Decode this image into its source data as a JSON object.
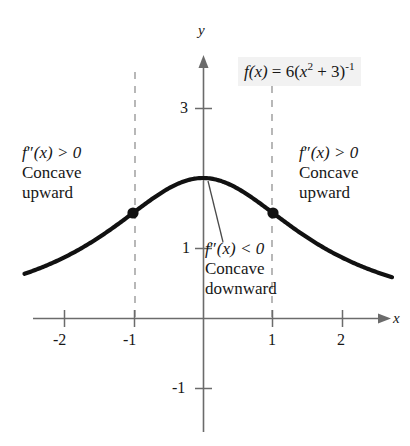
{
  "figure": {
    "background": "#ffffff",
    "curve_color": "#111111",
    "axis_color": "#6b6b6b",
    "dashed_color": "#9a9a9a",
    "label_bg": "#f2f2f2"
  },
  "axes": {
    "x_label": "x",
    "y_label": "y",
    "x_ticks": [
      "-2",
      "-1",
      "1",
      "2"
    ],
    "y_ticks": [
      "3",
      "1",
      "-1"
    ],
    "x_range": [
      -2.55,
      2.7
    ],
    "y_range": [
      -1.55,
      3.55
    ],
    "origin_px": [
      203,
      318
    ],
    "unit_px": 70
  },
  "formula": {
    "lead": "f",
    "arg": "(x)",
    "equals": "= 6(",
    "base": "x",
    "power": "2",
    "plus3": "+ 3)",
    "outer_power": "-1",
    "plain": "f(x) = 6(x² + 3)⁻¹"
  },
  "annotations": {
    "left": {
      "math_f": "f",
      "math_primes": "″",
      "math_rest": "(x) > 0",
      "line2": "Concave",
      "line3": "upward",
      "plain": "f″(x) > 0 Concave upward"
    },
    "right": {
      "math_f": "f",
      "math_primes": "″",
      "math_rest": "(x) > 0",
      "line2": "Concave",
      "line3": "upward",
      "plain": "f″(x) > 0 Concave upward"
    },
    "center": {
      "math_f": "f",
      "math_primes": "″",
      "math_rest": "(x) < 0",
      "line2": "Concave",
      "line3": "downward",
      "plain": "f″(x) < 0 Concave downward"
    }
  },
  "chart_data": {
    "type": "line",
    "xlabel": "x",
    "ylabel": "y",
    "xlim": [
      -2.55,
      2.7
    ],
    "ylim": [
      -1.55,
      3.55
    ],
    "xticks": [
      -2,
      -1,
      1,
      2
    ],
    "yticks": [
      3,
      1,
      -1
    ],
    "grid": false,
    "legend": "none",
    "series": [
      {
        "name": "f(x) = 6(x^2 + 3)^-1",
        "formula": "6/(x^2+3)",
        "x": [
          -2.45,
          -2.2,
          -2.0,
          -1.75,
          -1.5,
          -1.25,
          -1.0,
          -0.75,
          -0.5,
          -0.25,
          0.0,
          0.25,
          0.5,
          0.75,
          1.0,
          1.25,
          1.5,
          1.75,
          2.0,
          2.2,
          2.45
        ],
        "y": [
          0.665,
          0.76,
          0.857,
          0.97,
          1.143,
          1.309,
          1.5,
          1.68,
          1.846,
          1.959,
          2.0,
          1.959,
          1.846,
          1.68,
          1.5,
          1.309,
          1.143,
          0.97,
          0.857,
          0.76,
          0.665
        ]
      }
    ],
    "points_of_interest": [
      {
        "name": "inflection-point-left",
        "x": -1,
        "y": 1.5,
        "marker": "filled-circle"
      },
      {
        "name": "inflection-point-right",
        "x": 1,
        "y": 1.5,
        "marker": "filled-circle"
      },
      {
        "name": "maximum",
        "x": 0,
        "y": 2,
        "marker": "none"
      }
    ],
    "vertical_dashed_lines": [
      -1,
      1
    ],
    "annotations": [
      {
        "text": "f″(x) > 0 Concave upward",
        "region": "x < -1"
      },
      {
        "text": "f″(x) < 0 Concave downward",
        "region": "-1 < x < 1",
        "leader_to": [
          0.07,
          1.96
        ]
      },
      {
        "text": "f″(x) > 0 Concave upward",
        "region": "x > 1"
      }
    ]
  }
}
